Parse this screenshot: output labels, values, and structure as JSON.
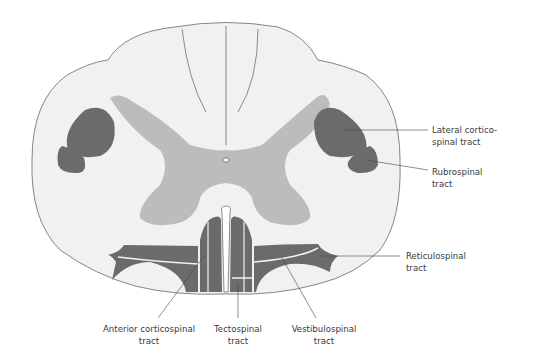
{
  "diagram": {
    "colors": {
      "white_matter": "#f1f1f1",
      "gray_matter": "#bcbcbc",
      "tract_fill": "#6b6b6b",
      "outline": "#555555",
      "leader_line": "#444444",
      "label_text": "#3a3a3a"
    },
    "labels": {
      "lateral_corticospinal": {
        "line1": "Lateral cortico-",
        "line2": "spinal tract"
      },
      "rubrospinal": {
        "line1": "Rubrospinal",
        "line2": "tract"
      },
      "reticulospinal": {
        "line1": "Reticulospinal",
        "line2": "tract"
      },
      "anterior_corticospinal": {
        "line1": "Anterior corticospinal",
        "line2": "tract"
      },
      "tectospinal": {
        "line1": "Tectospinal",
        "line2": "tract"
      },
      "vestibulospinal": {
        "line1": "Vestibulospinal",
        "line2": "tract"
      }
    }
  }
}
